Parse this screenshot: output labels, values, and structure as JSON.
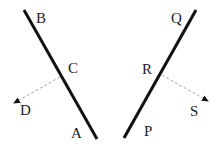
{
  "diagram": {
    "line1": {
      "start_label": "B",
      "mid_label": "C",
      "end_label": "A",
      "ray_label": "D"
    },
    "line2": {
      "start_label": "Q",
      "mid_label": "R",
      "end_label": "P",
      "ray_label": "S"
    },
    "colors": {
      "line": "#111111",
      "dashed": "#999999",
      "text": "#222222"
    }
  }
}
